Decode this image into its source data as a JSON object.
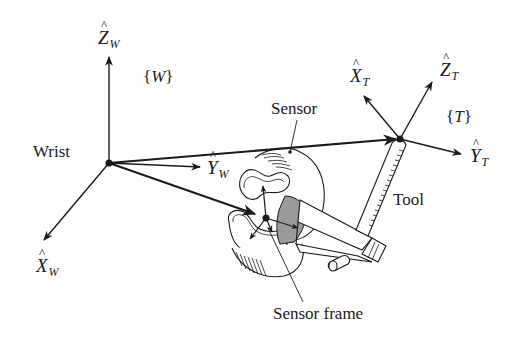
{
  "diagram": {
    "frames": {
      "wrist": {
        "label": "{W}",
        "symbol": "W",
        "name": "Wrist"
      },
      "tool": {
        "label": "{T}",
        "symbol": "T",
        "name": "Tool"
      },
      "sensor": {
        "name": "Sensor frame"
      }
    },
    "axes": {
      "z_w": {
        "letter": "Z",
        "sub": "W"
      },
      "y_w": {
        "letter": "Y",
        "sub": "W"
      },
      "x_w": {
        "letter": "X",
        "sub": "W"
      },
      "x_t": {
        "letter": "X",
        "sub": "T"
      },
      "z_t": {
        "letter": "Z",
        "sub": "T"
      },
      "y_t": {
        "letter": "Y",
        "sub": "T"
      }
    },
    "labels": {
      "wrist": "Wrist",
      "sensor": "Sensor",
      "tool": "Tool",
      "sensor_frame": "Sensor frame",
      "frame_w_open": "{",
      "frame_w_letter": "W",
      "frame_w_close": "}",
      "frame_t_open": "{",
      "frame_t_letter": "T",
      "frame_t_close": "}"
    },
    "colors": {
      "ink": "#1a1a1a",
      "shade": "#9a9a9a",
      "background": "#ffffff"
    }
  }
}
